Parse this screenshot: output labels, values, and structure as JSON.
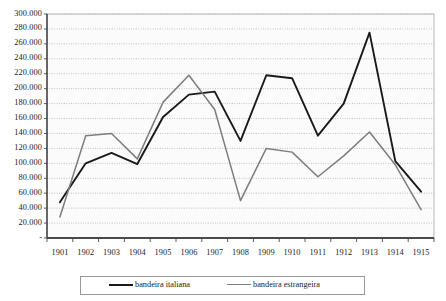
{
  "chart_data": {
    "type": "line",
    "title": "",
    "subtitle": "",
    "xlabel": "",
    "ylabel": "",
    "categories": [
      "1901",
      "1902",
      "1903",
      "1904",
      "1905",
      "1906",
      "1907",
      "1908",
      "1909",
      "1910",
      "1911",
      "1912",
      "1913",
      "1914",
      "1915"
    ],
    "ylim": [
      0,
      300000
    ],
    "ytick_step": 20000,
    "ytick_labels": [
      "300.000",
      "280.000",
      "260.000",
      "240.000",
      "220.000",
      "200.000",
      "180.000",
      "160.000",
      "140.000",
      "120.000",
      "100.000",
      "80.000",
      "60.000",
      "40.000",
      "20.000",
      "-"
    ],
    "ytick_values": [
      300000,
      280000,
      260000,
      240000,
      220000,
      200000,
      180000,
      160000,
      140000,
      120000,
      100000,
      80000,
      60000,
      40000,
      20000,
      0
    ],
    "grid": true,
    "grid_axis": "y",
    "legend_position": "bottom",
    "series": [
      {
        "name": "bandeira italiana",
        "color": "#1a1a1a",
        "values": [
          48000,
          100000,
          114000,
          99000,
          162000,
          192000,
          196000,
          130000,
          218000,
          214000,
          137000,
          180000,
          275000,
          103000,
          62000
        ]
      },
      {
        "name": "bandeira estrangeira",
        "color": "#7d7d7d",
        "values": [
          28000,
          137000,
          140000,
          106000,
          182000,
          218000,
          172000,
          50000,
          120000,
          115000,
          82000,
          110000,
          142000,
          98000,
          38000
        ]
      }
    ]
  },
  "legend": {
    "items": [
      {
        "label": "bandeira italiana"
      },
      {
        "label": "bandeira estrangeira"
      }
    ]
  }
}
